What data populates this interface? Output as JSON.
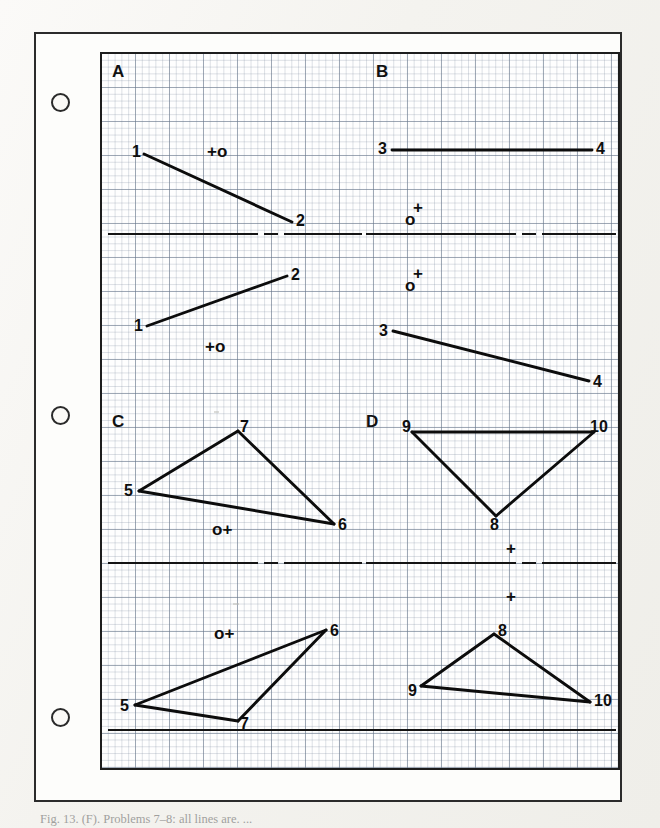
{
  "sheet": {
    "caption": "Fig. 13. (F). Problems 7–8: all lines are. ...",
    "hole_punches": [
      {
        "name": "hole-punch-top",
        "x": 51,
        "y": 93
      },
      {
        "name": "hole-punch-middle",
        "x": 51,
        "y": 406
      },
      {
        "name": "hole-punch-bottom",
        "x": 51,
        "y": 708
      }
    ]
  },
  "chart_data": {
    "type": "diagram",
    "grid": {
      "major_px": 34,
      "minor_px": 6.8,
      "on": true
    },
    "frame": {
      "x": 100,
      "y": 52,
      "width": 520,
      "height": 718
    },
    "panels": [
      {
        "id": "A",
        "label": "A",
        "label_pos": {
          "x": 10,
          "y": 8
        },
        "views": [
          {
            "name": "top-view",
            "segments": [
              {
                "from": [
                  42,
                  100
                ],
                "to": [
                  190,
                  168
                ]
              }
            ],
            "point_labels": [
              {
                "text": "1",
                "x": 30,
                "y": 89
              },
              {
                "text": "2",
                "x": 194,
                "y": 158
              }
            ],
            "markers": [
              {
                "text": "+o",
                "x": 105,
                "y": 88
              }
            ]
          },
          {
            "name": "front-view",
            "segments": [
              {
                "from": [
                  45,
                  272
                ],
                "to": [
                  185,
                  222
                ]
              }
            ],
            "point_labels": [
              {
                "text": "1",
                "x": 32,
                "y": 263
              },
              {
                "text": "2",
                "x": 189,
                "y": 212
              }
            ],
            "markers": [
              {
                "text": "+o",
                "x": 103,
                "y": 283
              }
            ]
          }
        ]
      },
      {
        "id": "B",
        "label": "B",
        "label_pos": {
          "x": 274,
          "y": 8
        },
        "views": [
          {
            "name": "top-view",
            "segments": [
              {
                "from": [
                  290,
                  96
                ],
                "to": [
                  490,
                  96
                ]
              }
            ],
            "point_labels": [
              {
                "text": "3",
                "x": 276,
                "y": 86
              },
              {
                "text": "4",
                "x": 494,
                "y": 86
              }
            ],
            "markers": [
              {
                "text": "o",
                "x": 303,
                "y": 156
              },
              {
                "text": "+",
                "x": 311,
                "y": 144
              }
            ]
          },
          {
            "name": "front-view",
            "segments": [
              {
                "from": [
                  291,
                  277
                ],
                "to": [
                  487,
                  327
                ]
              }
            ],
            "point_labels": [
              {
                "text": "3",
                "x": 277,
                "y": 268
              },
              {
                "text": "4",
                "x": 491,
                "y": 319
              }
            ],
            "markers": [
              {
                "text": "o",
                "x": 303,
                "y": 222
              },
              {
                "text": "+",
                "x": 311,
                "y": 210
              }
            ]
          }
        ]
      },
      {
        "id": "C",
        "label": "C",
        "label_pos": {
          "x": 10,
          "y": 358
        },
        "views": [
          {
            "name": "top-view",
            "segments": [
              {
                "from": [
                  37,
                  437
                ],
                "to": [
                  136,
                  377
                ]
              },
              {
                "from": [
                  136,
                  377
                ],
                "to": [
                  232,
                  470
                ]
              },
              {
                "from": [
                  232,
                  470
                ],
                "to": [
                  37,
                  437
                ]
              }
            ],
            "point_labels": [
              {
                "text": "5",
                "x": 22,
                "y": 428
              },
              {
                "text": "7",
                "x": 138,
                "y": 364
              },
              {
                "text": "6",
                "x": 236,
                "y": 462
              }
            ],
            "markers": [
              {
                "text": "o+",
                "x": 110,
                "y": 466
              }
            ]
          },
          {
            "name": "front-view",
            "segments": [
              {
                "from": [
                  33,
                  651
                ],
                "to": [
                  224,
                  576
                ]
              },
              {
                "from": [
                  224,
                  576
                ],
                "to": [
                  136,
                  667
                ]
              },
              {
                "from": [
                  136,
                  667
                ],
                "to": [
                  33,
                  651
                ]
              }
            ],
            "point_labels": [
              {
                "text": "5",
                "x": 18,
                "y": 643
              },
              {
                "text": "7",
                "x": 138,
                "y": 661
              },
              {
                "text": "6",
                "x": 228,
                "y": 568
              }
            ],
            "markers": [
              {
                "text": "o+",
                "x": 112,
                "y": 570
              }
            ]
          }
        ]
      },
      {
        "id": "D",
        "label": "D",
        "label_pos": {
          "x": 264,
          "y": 358
        },
        "views": [
          {
            "name": "top-view",
            "segments": [
              {
                "from": [
                  310,
                  378
                ],
                "to": [
                  492,
                  378
                ]
              },
              {
                "from": [
                  492,
                  378
                ],
                "to": [
                  394,
                  462
                ]
              },
              {
                "from": [
                  394,
                  462
                ],
                "to": [
                  310,
                  378
                ]
              }
            ],
            "point_labels": [
              {
                "text": "9",
                "x": 300,
                "y": 364
              },
              {
                "text": "10",
                "x": 488,
                "y": 364
              },
              {
                "text": "8",
                "x": 388,
                "y": 462
              }
            ],
            "markers": [
              {
                "text": "+",
                "x": 404,
                "y": 485
              },
              {
                "text": "+",
                "x": 404,
                "y": 533
              }
            ]
          },
          {
            "name": "front-view",
            "segments": [
              {
                "from": [
                  319,
                  632
                ],
                "to": [
                  392,
                  580
                ]
              },
              {
                "from": [
                  392,
                  580
                ],
                "to": [
                  488,
                  648
                ]
              },
              {
                "from": [
                  488,
                  648
                ],
                "to": [
                  319,
                  632
                ]
              }
            ],
            "point_labels": [
              {
                "text": "8",
                "x": 396,
                "y": 568
              },
              {
                "text": "9",
                "x": 306,
                "y": 628
              },
              {
                "text": "10",
                "x": 492,
                "y": 638
              }
            ],
            "markers": []
          }
        ]
      }
    ],
    "fold_lines": [
      {
        "name": "fold-line-left-upper",
        "y": 180,
        "x1": 6,
        "x2": 260
      },
      {
        "name": "fold-line-right-upper",
        "y": 180,
        "x1": 264,
        "x2": 514
      },
      {
        "name": "fold-line-left-lower",
        "y": 509,
        "x1": 6,
        "x2": 260
      },
      {
        "name": "fold-line-right-lower",
        "y": 509,
        "x1": 264,
        "x2": 514
      },
      {
        "name": "baseline-lower",
        "y": 676,
        "x1": 6,
        "x2": 514
      }
    ]
  }
}
